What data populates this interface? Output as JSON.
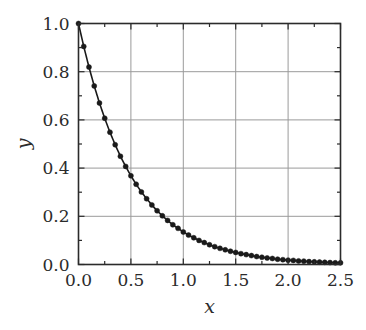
{
  "chart_data": {
    "type": "line",
    "title": "",
    "subtitle": "",
    "xlabel": "x",
    "ylabel": "y",
    "xlim": [
      0.0,
      2.5
    ],
    "ylim": [
      0.0,
      1.0
    ],
    "grid": true,
    "legend": null,
    "legend_position": "none",
    "xticks": [
      0.0,
      0.5,
      1.0,
      1.5,
      2.0,
      2.5
    ],
    "xticklabels": [
      "0.0",
      "0.5",
      "1.0",
      "1.5",
      "2.0",
      "2.5"
    ],
    "yticks": [
      0.0,
      0.2,
      0.4,
      0.6,
      0.8,
      1.0
    ],
    "yticklabels": [
      "0.0",
      "0.2",
      "0.4",
      "0.6",
      "0.8",
      "1.0"
    ],
    "xminorticks": [
      0.25,
      0.75,
      1.25,
      1.75,
      2.25
    ],
    "yminorticks": [
      0.1,
      0.3,
      0.5,
      0.7,
      0.9
    ],
    "series": [
      {
        "name": "decay",
        "marker": "filled-circle",
        "line_color": "#1a1a1a",
        "marker_color": "#1a1a1a",
        "x": [
          0.0,
          0.05,
          0.1,
          0.15,
          0.2,
          0.25,
          0.3,
          0.35,
          0.4,
          0.45,
          0.5,
          0.55,
          0.6,
          0.65,
          0.7,
          0.75,
          0.8,
          0.85,
          0.9,
          0.95,
          1.0,
          1.05,
          1.1,
          1.15,
          1.2,
          1.25,
          1.3,
          1.35,
          1.4,
          1.45,
          1.5,
          1.55,
          1.6,
          1.65,
          1.7,
          1.75,
          1.8,
          1.85,
          1.9,
          1.95,
          2.0,
          2.05,
          2.1,
          2.15,
          2.2,
          2.25,
          2.3,
          2.35,
          2.4,
          2.45,
          2.5
        ],
        "y": [
          1.0,
          0.905,
          0.819,
          0.741,
          0.67,
          0.607,
          0.549,
          0.497,
          0.449,
          0.407,
          0.368,
          0.333,
          0.301,
          0.273,
          0.247,
          0.223,
          0.202,
          0.183,
          0.165,
          0.15,
          0.135,
          0.122,
          0.111,
          0.1,
          0.091,
          0.082,
          0.074,
          0.067,
          0.061,
          0.055,
          0.05,
          0.045,
          0.041,
          0.037,
          0.033,
          0.03,
          0.027,
          0.025,
          0.022,
          0.02,
          0.018,
          0.017,
          0.015,
          0.014,
          0.012,
          0.011,
          0.01,
          0.009,
          0.008,
          0.007,
          0.007
        ]
      }
    ],
    "annotations": []
  },
  "style": {
    "axis_color": "#2b2b2b",
    "grid_color": "#9a9a9a",
    "background": "#ffffff",
    "text_color": "#2b2b2b"
  }
}
